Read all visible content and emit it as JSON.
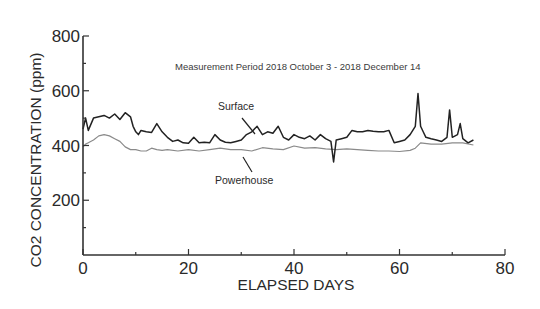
{
  "chart_data": {
    "type": "line",
    "title": "",
    "annotation": "Measurement Period 2018 October 3 - 2018 December 14",
    "xlabel": "ELAPSED DAYS",
    "ylabel": "CO2 CONCENTRATION (ppm)",
    "xlim": [
      0,
      80
    ],
    "ylim": [
      0,
      800
    ],
    "x_ticks": [
      0,
      20,
      40,
      60,
      80
    ],
    "x_tick_labels": [
      "0",
      "20",
      "40",
      "60",
      "80"
    ],
    "x_minor_ticks": [
      10,
      30,
      50,
      70
    ],
    "y_ticks": [
      200,
      400,
      600,
      800
    ],
    "y_tick_labels": [
      "200",
      "400",
      "600",
      "800"
    ],
    "y_minor_ticks": [
      100,
      300,
      500,
      700
    ],
    "grid": false,
    "legend": "inline labels with arrows",
    "series": [
      {
        "name": "Surface",
        "color": "#222222",
        "x": [
          0,
          0.5,
          1,
          2,
          3,
          4,
          5,
          6,
          7,
          8,
          9,
          9.5,
          10,
          10.5,
          11,
          12,
          13,
          14,
          15,
          16,
          17,
          18,
          19,
          20,
          21,
          22,
          23,
          24,
          25,
          26,
          27,
          28,
          29,
          30,
          31,
          32,
          33,
          34,
          35,
          36,
          37,
          38,
          39,
          40,
          41,
          42,
          43,
          44,
          45,
          46,
          47,
          47.5,
          48,
          49,
          50,
          51,
          52,
          53,
          54,
          55,
          56,
          57,
          58,
          59,
          60,
          61,
          62,
          63,
          63.5,
          64,
          64.5,
          65,
          66,
          67,
          68,
          69,
          69.5,
          70,
          71,
          71.5,
          72,
          73,
          74
        ],
        "values": [
          460,
          500,
          455,
          500,
          505,
          510,
          500,
          515,
          495,
          520,
          505,
          470,
          450,
          440,
          455,
          450,
          448,
          480,
          450,
          430,
          415,
          420,
          410,
          408,
          430,
          410,
          412,
          410,
          440,
          420,
          412,
          410,
          415,
          420,
          440,
          450,
          470,
          440,
          450,
          445,
          470,
          430,
          420,
          440,
          430,
          425,
          435,
          420,
          440,
          425,
          415,
          340,
          420,
          425,
          430,
          455,
          450,
          450,
          455,
          452,
          450,
          450,
          455,
          410,
          415,
          420,
          440,
          470,
          590,
          470,
          450,
          430,
          425,
          420,
          415,
          430,
          530,
          430,
          440,
          480,
          425,
          410,
          420
        ]
      },
      {
        "name": "Powerhouse",
        "color": "#8a8a8a",
        "x": [
          0,
          0.5,
          1,
          2,
          3,
          4,
          5,
          6,
          7,
          8,
          9,
          10,
          11,
          12,
          13,
          14,
          15,
          16,
          18,
          20,
          22,
          24,
          26,
          28,
          30,
          32,
          34,
          36,
          38,
          40,
          42,
          44,
          46,
          48,
          50,
          52,
          54,
          56,
          58,
          60,
          62,
          63,
          64,
          66,
          68,
          70,
          72,
          74
        ],
        "values": [
          395,
          405,
          410,
          420,
          435,
          440,
          435,
          425,
          415,
          395,
          385,
          385,
          380,
          380,
          390,
          385,
          382,
          385,
          380,
          385,
          380,
          385,
          390,
          385,
          385,
          380,
          392,
          388,
          385,
          398,
          390,
          392,
          388,
          385,
          388,
          385,
          382,
          380,
          380,
          378,
          382,
          390,
          410,
          405,
          405,
          410,
          410,
          402
        ]
      }
    ]
  }
}
